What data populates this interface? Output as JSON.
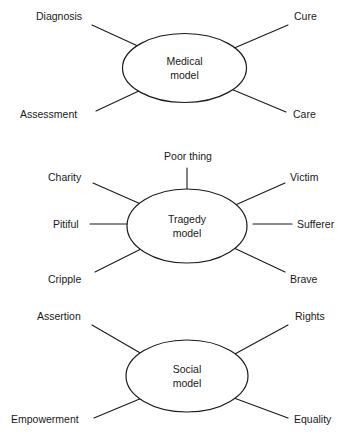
{
  "diagram": {
    "type": "radial-spoke-diagram",
    "background_color": "#ffffff",
    "line_color": "#1a1a1a",
    "text_color": "#1a1a1a",
    "groups": [
      {
        "id": "medical",
        "center_line1": "Medical",
        "center_line2": "model",
        "nodes": [
          {
            "id": "diagnosis",
            "label": "Diagnosis"
          },
          {
            "id": "cure",
            "label": "Cure"
          },
          {
            "id": "assessment",
            "label": "Assessment"
          },
          {
            "id": "care",
            "label": "Care"
          }
        ]
      },
      {
        "id": "tragedy",
        "center_line1": "Tragedy",
        "center_line2": "model",
        "nodes": [
          {
            "id": "poor-thing",
            "label": "Poor thing"
          },
          {
            "id": "charity",
            "label": "Charity"
          },
          {
            "id": "victim",
            "label": "Victim"
          },
          {
            "id": "pitiful",
            "label": "Pitiful"
          },
          {
            "id": "sufferer",
            "label": "Sufferer"
          },
          {
            "id": "cripple",
            "label": "Cripple"
          },
          {
            "id": "brave",
            "label": "Brave"
          }
        ]
      },
      {
        "id": "social",
        "center_line1": "Social",
        "center_line2": "model",
        "nodes": [
          {
            "id": "assertion",
            "label": "Assertion"
          },
          {
            "id": "rights",
            "label": "Rights"
          },
          {
            "id": "empowerment",
            "label": "Empowerment"
          },
          {
            "id": "equality",
            "label": "Equality"
          }
        ]
      }
    ]
  }
}
